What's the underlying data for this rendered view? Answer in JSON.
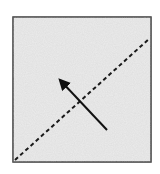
{
  "diagram": {
    "box": {
      "x": 13,
      "y": 17,
      "width": 138,
      "height": 145,
      "fill": "#ececec",
      "stroke": "#3a3a3a"
    },
    "dashed_line": {
      "x1": 15,
      "y1": 160,
      "x2": 150,
      "y2": 38,
      "color": "#1a1a1a",
      "dash": "4,3"
    },
    "arrow": {
      "x1": 107,
      "y1": 130,
      "x2": 58,
      "y2": 78,
      "color": "#111111"
    }
  }
}
